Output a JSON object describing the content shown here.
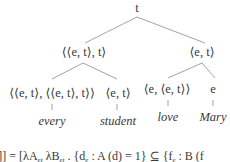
{
  "tree": {
    "root": {
      "label": "t"
    },
    "level1": [
      {
        "label": "⟨⟨e, t⟩, t⟩"
      },
      {
        "label": "⟨e, t⟩"
      }
    ],
    "level2": [
      {
        "label": "⟨⟨e, t⟩, ⟨⟨e, t⟩, t⟩⟩"
      },
      {
        "label": "⟨e, t⟩"
      },
      {
        "label": "⟨e, ⟨e, t⟩⟩"
      },
      {
        "label": "e"
      }
    ],
    "leaves": [
      {
        "word": "every"
      },
      {
        "word": "student"
      },
      {
        "word": "love"
      },
      {
        "word": "Mary"
      }
    ]
  },
  "formula": {
    "lhs_fragment": "ery",
    "bracket_close": "]] = [λA",
    "sub_et1": "et",
    "lambda_b": " λB",
    "sub_et2": "et",
    "set1_open": " . {d",
    "sub_e1": "e",
    "set1_body": " : A (d) = 1} ⊆ {f",
    "sub_e2": "e",
    "set2_body": " : B (f"
  }
}
